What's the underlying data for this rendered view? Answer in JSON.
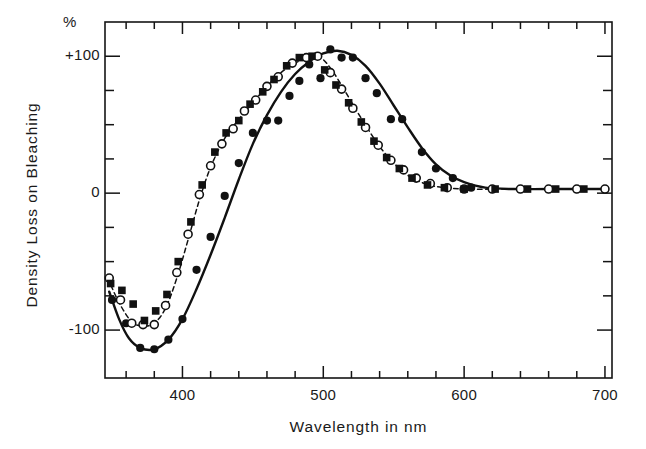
{
  "figure": {
    "unit_label": "%",
    "ylabel": "Density Loss on Bleaching",
    "xlabel": "Wavelength  in  nm"
  },
  "axes": {
    "y_ticks_major": [
      {
        "value": 100,
        "label": "+100"
      },
      {
        "value": 0,
        "label": "0"
      },
      {
        "value": -100,
        "label": "-100"
      }
    ],
    "y_ticks_minor": [
      75,
      50,
      25,
      -25,
      -50,
      -75
    ],
    "x_ticks_major": [
      {
        "value": 400,
        "label": "400"
      },
      {
        "value": 500,
        "label": "500"
      },
      {
        "value": 600,
        "label": "600"
      },
      {
        "value": 700,
        "label": "700"
      }
    ],
    "x_ticks_minor": [
      360,
      380,
      420,
      440,
      460,
      480,
      520,
      540,
      560,
      580,
      620,
      640,
      660,
      680
    ]
  },
  "chart_data": {
    "type": "scatter",
    "title": "",
    "xlabel": "Wavelength in nm",
    "ylabel": "Density Loss on Bleaching",
    "unit": "%",
    "xlim": [
      345,
      705
    ],
    "ylim": [
      -135,
      125
    ],
    "grid": false,
    "legend": "none",
    "series": [
      {
        "name": "filled-circle-solid",
        "marker": "filled-circle",
        "line": "solid",
        "color": "#111111",
        "points": [
          {
            "x": 350,
            "y": -78
          },
          {
            "x": 360,
            "y": -95
          },
          {
            "x": 370,
            "y": -113
          },
          {
            "x": 380,
            "y": -114
          },
          {
            "x": 390,
            "y": -107
          },
          {
            "x": 400,
            "y": -92
          },
          {
            "x": 410,
            "y": -56
          },
          {
            "x": 420,
            "y": -32
          },
          {
            "x": 430,
            "y": -2
          },
          {
            "x": 440,
            "y": 22
          },
          {
            "x": 450,
            "y": 44
          },
          {
            "x": 460,
            "y": 53
          },
          {
            "x": 468,
            "y": 53
          },
          {
            "x": 476,
            "y": 71
          },
          {
            "x": 483,
            "y": 82
          },
          {
            "x": 490,
            "y": 94
          },
          {
            "x": 498,
            "y": 84
          },
          {
            "x": 505,
            "y": 105
          },
          {
            "x": 513,
            "y": 99
          },
          {
            "x": 521,
            "y": 99
          },
          {
            "x": 530,
            "y": 84
          },
          {
            "x": 538,
            "y": 73
          },
          {
            "x": 548,
            "y": 54
          },
          {
            "x": 556,
            "y": 54
          },
          {
            "x": 570,
            "y": 30
          },
          {
            "x": 580,
            "y": 18
          },
          {
            "x": 592,
            "y": 11
          },
          {
            "x": 605,
            "y": 4
          },
          {
            "x": 620,
            "y": 3
          },
          {
            "x": 640,
            "y": 3
          },
          {
            "x": 660,
            "y": 3
          },
          {
            "x": 680,
            "y": 3
          },
          {
            "x": 700,
            "y": 3
          }
        ],
        "curve": [
          {
            "x": 348,
            "y": -72
          },
          {
            "x": 355,
            "y": -92
          },
          {
            "x": 362,
            "y": -106
          },
          {
            "x": 370,
            "y": -113
          },
          {
            "x": 380,
            "y": -114
          },
          {
            "x": 390,
            "y": -107
          },
          {
            "x": 400,
            "y": -92
          },
          {
            "x": 410,
            "y": -70
          },
          {
            "x": 420,
            "y": -45
          },
          {
            "x": 430,
            "y": -18
          },
          {
            "x": 440,
            "y": 10
          },
          {
            "x": 450,
            "y": 36
          },
          {
            "x": 460,
            "y": 57
          },
          {
            "x": 470,
            "y": 74
          },
          {
            "x": 480,
            "y": 87
          },
          {
            "x": 490,
            "y": 96
          },
          {
            "x": 500,
            "y": 102
          },
          {
            "x": 510,
            "y": 104
          },
          {
            "x": 520,
            "y": 101
          },
          {
            "x": 530,
            "y": 93
          },
          {
            "x": 540,
            "y": 80
          },
          {
            "x": 550,
            "y": 64
          },
          {
            "x": 560,
            "y": 48
          },
          {
            "x": 570,
            "y": 33
          },
          {
            "x": 580,
            "y": 21
          },
          {
            "x": 590,
            "y": 13
          },
          {
            "x": 600,
            "y": 8
          },
          {
            "x": 615,
            "y": 4
          },
          {
            "x": 635,
            "y": 3
          },
          {
            "x": 660,
            "y": 3
          },
          {
            "x": 700,
            "y": 3
          }
        ]
      },
      {
        "name": "open-circle-dashed",
        "marker": "open-circle",
        "line": "dashed",
        "color": "#111111",
        "points": [
          {
            "x": 348,
            "y": -62
          },
          {
            "x": 356,
            "y": -78
          },
          {
            "x": 364,
            "y": -95
          },
          {
            "x": 372,
            "y": -96
          },
          {
            "x": 380,
            "y": -96
          },
          {
            "x": 388,
            "y": -82
          },
          {
            "x": 396,
            "y": -58
          },
          {
            "x": 404,
            "y": -30
          },
          {
            "x": 412,
            "y": -1
          },
          {
            "x": 420,
            "y": 20
          },
          {
            "x": 428,
            "y": 36
          },
          {
            "x": 436,
            "y": 47
          },
          {
            "x": 444,
            "y": 60
          },
          {
            "x": 452,
            "y": 68
          },
          {
            "x": 460,
            "y": 78
          },
          {
            "x": 468,
            "y": 85
          },
          {
            "x": 478,
            "y": 95
          },
          {
            "x": 488,
            "y": 99
          },
          {
            "x": 496,
            "y": 100
          },
          {
            "x": 505,
            "y": 88
          },
          {
            "x": 513,
            "y": 76
          },
          {
            "x": 521,
            "y": 62
          },
          {
            "x": 530,
            "y": 48
          },
          {
            "x": 539,
            "y": 35
          },
          {
            "x": 548,
            "y": 24
          },
          {
            "x": 557,
            "y": 17
          },
          {
            "x": 566,
            "y": 11
          },
          {
            "x": 576,
            "y": 7
          },
          {
            "x": 588,
            "y": 4
          },
          {
            "x": 600,
            "y": 3
          },
          {
            "x": 620,
            "y": 3
          },
          {
            "x": 640,
            "y": 3
          },
          {
            "x": 660,
            "y": 3
          },
          {
            "x": 680,
            "y": 3
          },
          {
            "x": 700,
            "y": 3
          }
        ],
        "curve": [
          {
            "x": 347,
            "y": -62
          },
          {
            "x": 355,
            "y": -80
          },
          {
            "x": 364,
            "y": -94
          },
          {
            "x": 372,
            "y": -97
          },
          {
            "x": 380,
            "y": -95
          },
          {
            "x": 388,
            "y": -84
          },
          {
            "x": 396,
            "y": -62
          },
          {
            "x": 404,
            "y": -34
          },
          {
            "x": 412,
            "y": -5
          },
          {
            "x": 420,
            "y": 19
          },
          {
            "x": 430,
            "y": 40
          },
          {
            "x": 440,
            "y": 54
          },
          {
            "x": 450,
            "y": 66
          },
          {
            "x": 460,
            "y": 78
          },
          {
            "x": 470,
            "y": 88
          },
          {
            "x": 480,
            "y": 95
          },
          {
            "x": 490,
            "y": 99
          },
          {
            "x": 498,
            "y": 99
          },
          {
            "x": 506,
            "y": 90
          },
          {
            "x": 514,
            "y": 77
          },
          {
            "x": 522,
            "y": 63
          },
          {
            "x": 531,
            "y": 48
          },
          {
            "x": 540,
            "y": 34
          },
          {
            "x": 550,
            "y": 22
          },
          {
            "x": 560,
            "y": 13
          },
          {
            "x": 572,
            "y": 7
          },
          {
            "x": 586,
            "y": 4
          },
          {
            "x": 605,
            "y": 3
          },
          {
            "x": 630,
            "y": 3
          },
          {
            "x": 660,
            "y": 3
          },
          {
            "x": 700,
            "y": 3
          }
        ]
      },
      {
        "name": "filled-square",
        "marker": "filled-square",
        "line": "none",
        "color": "#111111",
        "points": [
          {
            "x": 349,
            "y": -66
          },
          {
            "x": 357,
            "y": -71
          },
          {
            "x": 365,
            "y": -81
          },
          {
            "x": 373,
            "y": -93
          },
          {
            "x": 381,
            "y": -86
          },
          {
            "x": 389,
            "y": -74
          },
          {
            "x": 397,
            "y": -50
          },
          {
            "x": 406,
            "y": -21
          },
          {
            "x": 414,
            "y": 6
          },
          {
            "x": 423,
            "y": 30
          },
          {
            "x": 431,
            "y": 44
          },
          {
            "x": 440,
            "y": 53
          },
          {
            "x": 448,
            "y": 65
          },
          {
            "x": 457,
            "y": 74
          },
          {
            "x": 465,
            "y": 83
          },
          {
            "x": 474,
            "y": 93
          },
          {
            "x": 483,
            "y": 99
          },
          {
            "x": 492,
            "y": 100
          },
          {
            "x": 501,
            "y": 90
          },
          {
            "x": 509,
            "y": 79
          },
          {
            "x": 518,
            "y": 66
          },
          {
            "x": 527,
            "y": 52
          },
          {
            "x": 536,
            "y": 38
          },
          {
            "x": 545,
            "y": 26
          },
          {
            "x": 554,
            "y": 18
          },
          {
            "x": 563,
            "y": 11
          },
          {
            "x": 574,
            "y": 6
          },
          {
            "x": 586,
            "y": 4
          },
          {
            "x": 600,
            "y": 3
          },
          {
            "x": 622,
            "y": 3
          },
          {
            "x": 645,
            "y": 3
          },
          {
            "x": 665,
            "y": 3
          },
          {
            "x": 685,
            "y": 3
          }
        ]
      }
    ]
  }
}
